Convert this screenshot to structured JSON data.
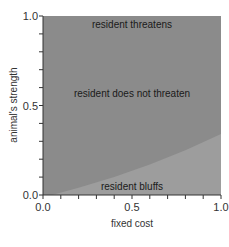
{
  "chart_data": {
    "type": "area",
    "title": "",
    "xlabel": "fixed cost",
    "ylabel": "animal's strength",
    "xlim": [
      0.0,
      1.0
    ],
    "ylim": [
      0.0,
      1.0
    ],
    "x_tick_labels": [
      "0.0",
      "0.5",
      "1.0"
    ],
    "y_tick_labels": [
      "0.0",
      "0.5",
      "1.0"
    ],
    "x_minor_ticks": 10,
    "y_minor_ticks": 10,
    "grid": false,
    "legend": null,
    "regions": [
      {
        "name": "resident threatens",
        "label_position": [
          0.5,
          0.96
        ]
      },
      {
        "name": "resident does not threaten",
        "label_position": [
          0.5,
          0.57
        ]
      },
      {
        "name": "resident bluffs",
        "label_position": [
          0.5,
          0.05
        ]
      }
    ],
    "boundary_bluff": {
      "x": [
        0.05,
        0.2,
        0.4,
        0.6,
        0.8,
        1.0
      ],
      "y": [
        0.0,
        0.04,
        0.1,
        0.17,
        0.25,
        0.34
      ]
    },
    "colors": {
      "main_region": "#8b8b8b",
      "bluff_region": "#9d9d9d",
      "axis": "#333333"
    }
  }
}
